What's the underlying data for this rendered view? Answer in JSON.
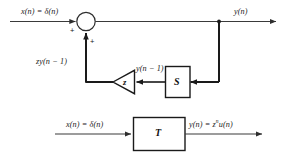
{
  "figure": {
    "background_color": "#ffffff",
    "line_color": "#3a3a3a",
    "bold_line_color": "#1a1a1a",
    "text_color": "#1a1a1a"
  },
  "top_diagram": {
    "input_label": "x(n) = δ(n)",
    "output_label": "y(n)",
    "feedback_label": "zy(n − 1)",
    "delay_output_label": "y(n − 1)",
    "summer": {
      "name": "summing-junction",
      "shape": "circle",
      "sign_input": "+",
      "sign_feedback": "+"
    },
    "gain_block": {
      "name": "gain-triangle",
      "shape": "triangle",
      "label": "z"
    },
    "delay_block": {
      "name": "system-block-s",
      "shape": "rectangle",
      "label": "S"
    }
  },
  "bottom_diagram": {
    "input_label": "x(n) = δ(n)",
    "block": {
      "name": "system-block-t",
      "shape": "rectangle",
      "label": "T"
    },
    "output_label_prefix": "y(n) = z",
    "output_label_exponent": "n",
    "output_label_suffix": "u(n)",
    "output_label_full": "y(n) = zⁿu(n)"
  }
}
